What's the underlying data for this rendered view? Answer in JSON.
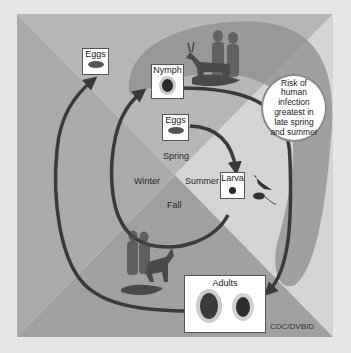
{
  "diagram": {
    "seasons": {
      "spring": "Spring",
      "summer": "Summer",
      "fall": "Fall",
      "winter": "Winter"
    },
    "stages": {
      "eggs_inner": "Eggs",
      "larva": "Larva",
      "nymph": "Nymph",
      "adults": "Adults",
      "eggs_outer": "Eggs"
    },
    "risk_callout": {
      "lines": [
        "Risk of",
        "human",
        "infection",
        "greatest in",
        "late spring",
        "and summer"
      ]
    },
    "hosts": {
      "larva_hosts": [
        "bird",
        "mouse"
      ],
      "nymph_hosts": [
        "humans",
        "deer",
        "dog",
        "small mammals"
      ],
      "adult_hosts": [
        "humans",
        "deer",
        "dog"
      ]
    },
    "credit": "CDC/DVBID",
    "colors": {
      "page_bg": "#e6e6e6",
      "quad_top": "#b4b4b4",
      "quad_right": "#d2d2d2",
      "quad_bottom": "#9c9c9c",
      "quad_left": "#a8a8a8",
      "risk_band": "#8f8f8f",
      "arrow": "#3a3a3a"
    }
  }
}
